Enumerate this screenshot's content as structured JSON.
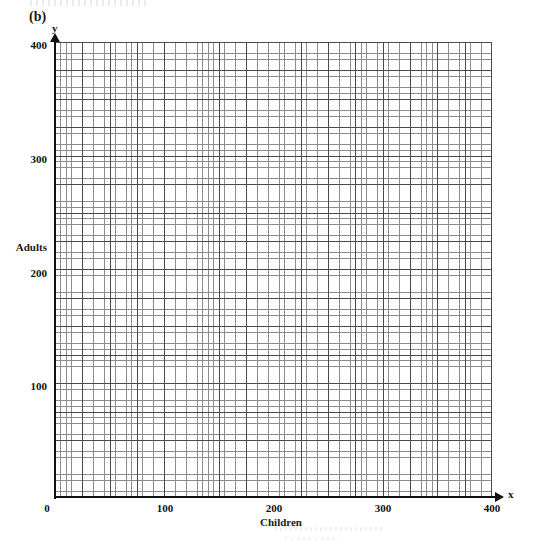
{
  "figure": {
    "part_label": "(b)",
    "axis_variable_y": "y",
    "axis_variable_x": "x",
    "axis_title_y": "Adults",
    "axis_title_x": "Children"
  },
  "chart_data": {
    "type": "scatter",
    "title": "(b)",
    "subtitle": "",
    "xlabel": "Children",
    "ylabel": "Adults",
    "x_variable": "x",
    "y_variable": "y",
    "xlim": [
      0,
      400
    ],
    "ylim": [
      0,
      400
    ],
    "x_ticks": [
      0,
      100,
      200,
      300,
      400
    ],
    "y_ticks": [
      0,
      100,
      200,
      300,
      400
    ],
    "x_tick_labels": [
      "0",
      "100",
      "200",
      "300",
      "400"
    ],
    "y_tick_labels": [
      "0",
      "100",
      "200",
      "300",
      "400"
    ],
    "x_major_step": 10,
    "y_major_step": 10,
    "x_minor_step": 2,
    "y_minor_step": 2,
    "grid": true,
    "grid_style": "graph-paper",
    "legend": null,
    "legend_position": "none",
    "series": [],
    "x": [],
    "values": [],
    "annotations": []
  },
  "ticks": {
    "y": {
      "t400": "400",
      "t300": "300",
      "t200": "200",
      "t100": "100"
    },
    "x": {
      "t0": "0",
      "t100": "100",
      "t200": "200",
      "t300": "300",
      "t400": "400"
    }
  }
}
